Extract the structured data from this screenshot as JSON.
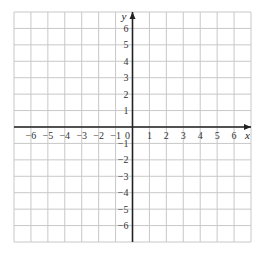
{
  "chart_data": {
    "type": "scatter",
    "title": "",
    "xlabel": "x",
    "ylabel": "y",
    "xlim": [
      -7,
      7
    ],
    "ylim": [
      -7,
      7
    ],
    "grid": true,
    "x_ticks": [
      -6,
      -5,
      -4,
      -3,
      -2,
      -1,
      0,
      1,
      2,
      3,
      4,
      5,
      6
    ],
    "y_ticks": [
      -6,
      -5,
      -4,
      -3,
      -2,
      -1,
      1,
      2,
      3,
      4,
      5,
      6
    ],
    "x_tick_labels": [
      "−6",
      "−5",
      "−4",
      "−3",
      "−2",
      "−1",
      "0",
      "1",
      "2",
      "3",
      "4",
      "5",
      "6"
    ],
    "y_tick_labels": [
      "−6",
      "−5",
      "−4",
      "−3",
      "−2",
      "−1",
      "1",
      "2",
      "3",
      "4",
      "5",
      "6"
    ],
    "series": [],
    "legend": null
  },
  "colors": {
    "grid": "#c8c8c8",
    "axis": "#222222",
    "label": "#333333"
  },
  "layout": {
    "left": 14,
    "top": 12,
    "right": 251,
    "bottom": 242
  }
}
